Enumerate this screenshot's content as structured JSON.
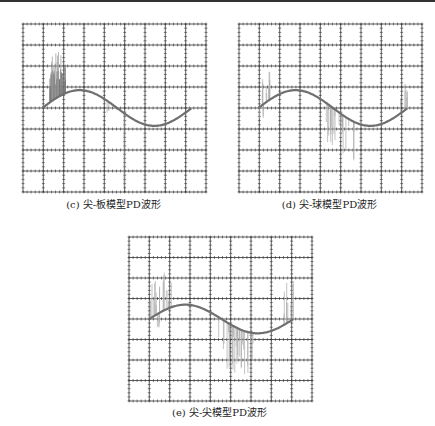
{
  "captions": {
    "c": "(c) 尖-板模型PD波形",
    "d": "(d) 尖-球模型PD波形",
    "e": "(e) 尖-尖模型PD波形"
  },
  "chart_data": [
    {
      "type": "line",
      "title": "(c) 尖-板模型PD波形",
      "grid": {
        "cols": 9,
        "rows": 8,
        "on": true
      },
      "series": [
        {
          "name": "sine",
          "description": "one cycle sine, starts at center line, peak ~+0.85 div, trough ~-0.85 div"
        },
        {
          "name": "PD pulses",
          "description": "dense positive pulses near phase 30-100°, up to ~+2.2 div; a few isolated negative spikes near phase 190-220°, down to ~-3.5 div"
        }
      ],
      "colors": {
        "grid": "#222222",
        "sine": "#777777",
        "pulses": "#888888"
      }
    },
    {
      "type": "line",
      "title": "(d) 尖-球模型PD波形",
      "grid": {
        "cols": 9,
        "rows": 8,
        "on": true
      },
      "series": [
        {
          "name": "sine",
          "description": "one cycle sine, peak ~+0.85 div, trough ~-0.85 div"
        },
        {
          "name": "PD pulses",
          "description": "sparse positive pulses near 0-30° (~+1.7 div), negative pulse cluster near 180-250° down to ~-2 div, small pulses near 350°"
        }
      ]
    },
    {
      "type": "line",
      "title": "(e) 尖-尖模型PD波形",
      "grid": {
        "cols": 9,
        "rows": 8,
        "on": true
      },
      "series": [
        {
          "name": "sine",
          "description": "one cycle sine, peak ~+0.7 div, trough ~-0.7 div"
        },
        {
          "name": "PD pulses",
          "description": "positive pulses near 10-60° up to ~+2 div, negative pulses near 180-260° down to ~-2.5 div, positive pulses near 340-360° up to ~+2 div"
        }
      ]
    }
  ]
}
